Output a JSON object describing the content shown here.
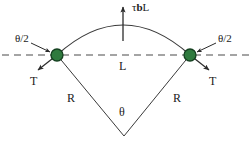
{
  "figure": {
    "type": "physics-free-body-diagram",
    "background_color": "#ffffff",
    "line_color": "#3a3a3a",
    "dashed_line_color": "#4a4a4a",
    "node_fill_color": "#2f7a3e",
    "node_stroke_color": "#14401f",
    "text_color": "#1a1a1a"
  },
  "labels": {
    "applied_force": "τbL",
    "applied_force_tau": "τ",
    "applied_force_b": "b",
    "applied_force_L": "L",
    "angle_half_left": "θ/2",
    "angle_half_right": "θ/2",
    "tension_left": "T",
    "tension_right": "T",
    "segment_length": "L",
    "radius_left": "R",
    "radius_right": "R",
    "subtended_angle": "θ"
  },
  "geometry": {
    "node_left": {
      "x": 57,
      "y": 55
    },
    "node_right": {
      "x": 190,
      "y": 55
    },
    "node_radius": 6,
    "arc_apex": {
      "x": 123,
      "y": 25
    },
    "circle_center": {
      "x": 124,
      "y": 135
    },
    "dashed_line_y": 55,
    "dashed_line_x_start": 2,
    "dashed_line_x_end": 250,
    "force_arrow_tail": {
      "x": 123,
      "y": 40
    },
    "force_arrow_head": {
      "x": 123,
      "y": 5
    },
    "tension_left_tail": {
      "x": 57,
      "y": 55
    },
    "tension_left_head": {
      "x": 36,
      "y": 71
    },
    "tension_right_tail": {
      "x": 190,
      "y": 55
    },
    "tension_right_head": {
      "x": 211,
      "y": 71
    },
    "pointer_left_tail": {
      "x": 32,
      "y": 44
    },
    "pointer_left_head": {
      "x": 49,
      "y": 52
    },
    "pointer_right_tail": {
      "x": 215,
      "y": 44
    },
    "pointer_right_head": {
      "x": 198,
      "y": 52
    }
  }
}
